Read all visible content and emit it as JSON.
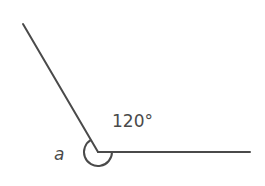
{
  "diagram": {
    "angle_label": "120°",
    "reflex_label": "a",
    "colors": {
      "stroke": "#4a4a4a",
      "background": "#ffffff"
    }
  }
}
